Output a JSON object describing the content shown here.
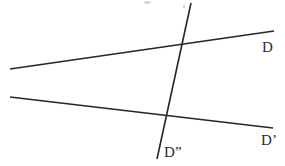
{
  "figure": {
    "background_color": "#ffffff",
    "width": 285,
    "height": 166,
    "stroke_color": "#26262a",
    "label_color": "#2b2b2b"
  },
  "labels": {
    "line_d": "D",
    "line_d_prime": "D’",
    "line_d_double_prime": "D”"
  },
  "chart_data": {
    "type": "diagram",
    "coordinate_space": {
      "x_range": [
        0,
        285
      ],
      "y_range": [
        0,
        166
      ],
      "units": "pixels"
    },
    "elements": [
      {
        "id": "line-d",
        "name": "line-D",
        "kind": "line-segment",
        "label": "D",
        "x1": 10,
        "y1": 69,
        "x2": 274,
        "y2": 31,
        "stroke_color": "#26262a",
        "stroke_width": 1.6
      },
      {
        "id": "line-d-prime",
        "name": "line-D-prime",
        "kind": "line-segment",
        "label": "D’",
        "x1": 10,
        "y1": 97,
        "x2": 273,
        "y2": 128,
        "stroke_color": "#26262a",
        "stroke_width": 1.6
      },
      {
        "id": "line-d-double-prime",
        "name": "line-D-double-prime",
        "kind": "line-segment",
        "label": "D”",
        "x1": 191,
        "y1": 3,
        "x2": 157,
        "y2": 159,
        "stroke_color": "#26262a",
        "stroke_width": 1.6
      }
    ],
    "intersections": [
      {
        "name": "intersection-D-and-Dpp",
        "lines": [
          "D",
          "D”"
        ],
        "x": 184,
        "y": 46
      },
      {
        "name": "intersection-Dprime-and-Dpp",
        "lines": [
          "D’",
          "D”"
        ],
        "x": 167,
        "y": 121
      }
    ],
    "label_positions": [
      {
        "text": "D",
        "x": 262,
        "y": 40,
        "anchor": "left-top"
      },
      {
        "text": "D’",
        "x": 261,
        "y": 133,
        "anchor": "left-top"
      },
      {
        "text": "D”",
        "x": 164,
        "y": 145,
        "anchor": "left-top"
      }
    ]
  }
}
